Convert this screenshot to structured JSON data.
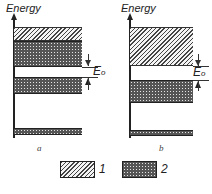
{
  "figure": {
    "panels": [
      {
        "id": "a",
        "axis_label": "Energy",
        "caption": "a",
        "gap_label": "E",
        "gap_subscript": "o",
        "bands": [
          {
            "type": "hatched",
            "legend": 1
          },
          {
            "type": "dotted",
            "legend": 2
          },
          {
            "type": "gap"
          },
          {
            "type": "dotted",
            "legend": 2
          },
          {
            "type": "dotted",
            "legend": 2
          }
        ]
      },
      {
        "id": "b",
        "axis_label": "Energy",
        "caption": "b",
        "gap_label": "E",
        "gap_subscript": "o",
        "bands": [
          {
            "type": "hatched",
            "legend": 1
          },
          {
            "type": "gap"
          },
          {
            "type": "dotted",
            "legend": 2
          },
          {
            "type": "dotted",
            "legend": 2
          }
        ]
      }
    ],
    "legend": [
      {
        "pattern": "hatched",
        "label": "1"
      },
      {
        "pattern": "dotted",
        "label": "2"
      }
    ]
  }
}
